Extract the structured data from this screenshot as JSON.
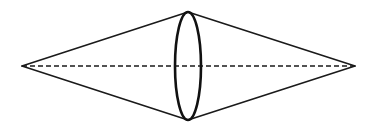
{
  "figure": {
    "canvas": {
      "width": 375,
      "height": 132,
      "background": "#ffffff"
    },
    "colors": {
      "stroke": "#1a1a1a",
      "ellipse_stroke": "#111111",
      "axis_stroke": "#1a1a1a",
      "background": "#ffffff"
    },
    "strokes": {
      "edge_width": 1.6,
      "ellipse_width": 2.6,
      "axis_width": 1.6,
      "axis_dash": "5 3"
    },
    "points": {
      "left_vertex": {
        "x": 22,
        "y": 66
      },
      "right_vertex": {
        "x": 355,
        "y": 66
      },
      "top_apex": {
        "x": 188,
        "y": 12
      },
      "bottom_apex": {
        "x": 188,
        "y": 120
      }
    },
    "mid_ellipse": {
      "cx": 188,
      "cy": 66,
      "rx": 13,
      "ry": 54
    },
    "axis": {
      "x1": 22,
      "y1": 66,
      "x2": 355,
      "y2": 66,
      "style": "dashed"
    },
    "edges": [
      {
        "name": "upper-left-edge",
        "from": "left_vertex",
        "to": "top_apex"
      },
      {
        "name": "upper-right-edge",
        "from": "top_apex",
        "to": "right_vertex"
      },
      {
        "name": "lower-right-edge",
        "from": "right_vertex",
        "to": "bottom_apex"
      },
      {
        "name": "lower-left-edge",
        "from": "bottom_apex",
        "to": "left_vertex"
      }
    ]
  }
}
